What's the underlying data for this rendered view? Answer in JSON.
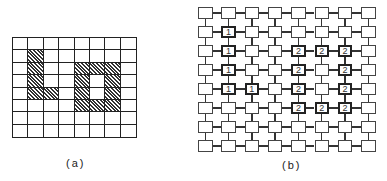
{
  "figure": {
    "panel_a": {
      "label": "(a)",
      "rows": 8,
      "cols": 8,
      "shaded_cells": [
        [
          1,
          1
        ],
        [
          2,
          1
        ],
        [
          3,
          1
        ],
        [
          4,
          1
        ],
        [
          4,
          2
        ],
        [
          2,
          4
        ],
        [
          2,
          5
        ],
        [
          2,
          6
        ],
        [
          3,
          4
        ],
        [
          3,
          6
        ],
        [
          4,
          4
        ],
        [
          4,
          6
        ],
        [
          5,
          4
        ],
        [
          5,
          5
        ],
        [
          5,
          6
        ]
      ],
      "hatch_color": "#333333"
    },
    "panel_b": {
      "label": "(b)",
      "rows": 8,
      "cols": 8,
      "node_labels": [
        [
          "",
          "",
          "",
          "",
          "",
          "",
          "",
          ""
        ],
        [
          "",
          "1",
          "",
          "",
          "",
          "",
          "",
          ""
        ],
        [
          "",
          "1",
          "",
          "",
          "2",
          "2",
          "2",
          ""
        ],
        [
          "",
          "1",
          "",
          "",
          "2",
          "",
          "2",
          ""
        ],
        [
          "",
          "1",
          "1",
          "",
          "2",
          "",
          "2",
          ""
        ],
        [
          "",
          "",
          "",
          "",
          "2",
          "2",
          "2",
          ""
        ],
        [
          "",
          "",
          "",
          "",
          "",
          "",
          "",
          ""
        ],
        [
          "",
          "",
          "",
          "",
          "",
          "",
          "",
          ""
        ]
      ]
    }
  }
}
